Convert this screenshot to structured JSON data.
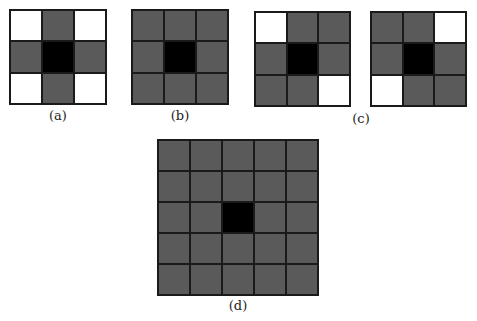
{
  "figure": {
    "panels": [
      {
        "id": "a",
        "label": "(a)",
        "size": 3,
        "pattern": [
          "w",
          "g",
          "w",
          "g",
          "c",
          "g",
          "w",
          "g",
          "w"
        ]
      },
      {
        "id": "b",
        "label": "(b)",
        "size": 3,
        "pattern": [
          "g",
          "g",
          "g",
          "g",
          "c",
          "g",
          "g",
          "g",
          "g"
        ]
      },
      {
        "id": "c1",
        "label": "",
        "size": 3,
        "pattern": [
          "w",
          "g",
          "g",
          "g",
          "c",
          "g",
          "g",
          "g",
          "w"
        ]
      },
      {
        "id": "c2",
        "label": "",
        "size": 3,
        "pattern": [
          "g",
          "g",
          "w",
          "g",
          "c",
          "g",
          "w",
          "g",
          "g"
        ]
      },
      {
        "id": "d",
        "label": "(d)",
        "size": 5,
        "pattern": [
          "g",
          "g",
          "g",
          "g",
          "g",
          "g",
          "g",
          "g",
          "g",
          "g",
          "g",
          "g",
          "c",
          "g",
          "g",
          "g",
          "g",
          "g",
          "g",
          "g",
          "g",
          "g",
          "g",
          "g",
          "g"
        ]
      }
    ],
    "labels": {
      "a": "(a)",
      "b": "(b)",
      "c": "(c)",
      "d": "(d)"
    },
    "colors": {
      "neighbor": "#5a5a5a",
      "center": "#000000",
      "empty": "#ffffff",
      "border": "#1a1a1a"
    }
  }
}
